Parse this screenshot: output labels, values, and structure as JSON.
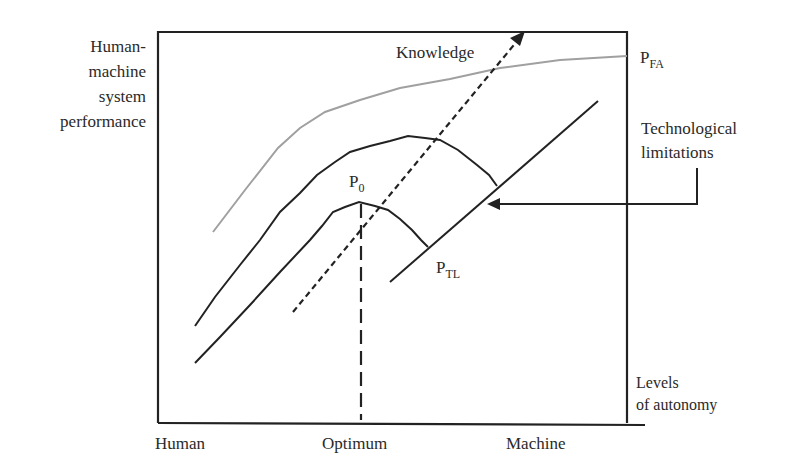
{
  "diagram": {
    "y_axis_label": [
      "Human-",
      "machine",
      "system",
      "performance"
    ],
    "x_axis_title": [
      "Levels",
      "of autonomy"
    ],
    "x_ticks": [
      "Human",
      "Optimum",
      "Machine"
    ],
    "annotations": {
      "knowledge": "Knowledge",
      "technological_limitations": [
        "Technological",
        "limitations"
      ],
      "p_fa": {
        "base": "P",
        "sub": "FA"
      },
      "p_0": {
        "base": "P",
        "sub": "0"
      },
      "p_tl": {
        "base": "P",
        "sub": "TL"
      }
    },
    "colors": {
      "line": "#222222",
      "fa_curve": "#a0a0a0",
      "background": "#ffffff"
    },
    "elements": [
      {
        "name": "P_FA curve",
        "style": "solid gray",
        "description": "Performance with full automation, highest curve"
      },
      {
        "name": "Intermediate curve",
        "style": "solid black",
        "description": "Performance curve after knowledge increase"
      },
      {
        "name": "P_0 curve",
        "style": "solid black",
        "description": "Current performance curve peaking at optimum P0"
      },
      {
        "name": "Technological limitations line",
        "style": "solid black",
        "description": "Diagonal boundary P_TL"
      },
      {
        "name": "Knowledge arrow",
        "style": "dashed arrow",
        "description": "Knowledge increase direction"
      },
      {
        "name": "Optimum line",
        "style": "dashed vertical",
        "description": "Optimum level of autonomy"
      }
    ]
  }
}
